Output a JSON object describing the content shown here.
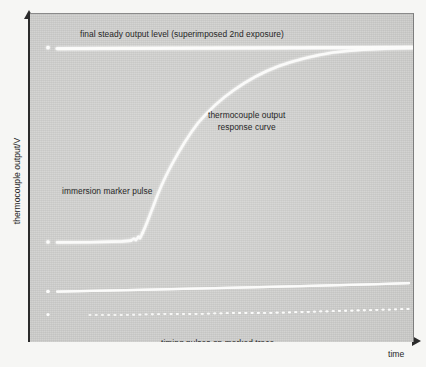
{
  "figure": {
    "kind": "oscilloscope-trace-photograph",
    "background_color": "#f6f6f4",
    "plot_background_color": "#d4d4d2",
    "trace_color": "#fbfbfa",
    "axis_color": "#2b2b2b"
  },
  "axes": {
    "y_title": "thermocouple output/V",
    "x_title": "time",
    "y_arrow_icon": "arrow-up-icon",
    "x_arrow_icon": "arrow-right-icon"
  },
  "annotations": {
    "final_level": "final steady output level (superimposed 2nd exposure)",
    "response_curve_line1": "thermocouple output",
    "response_curve_line2": "response curve",
    "immersion_marker": "immersion marker pulse",
    "timing_pulses": "timing pulses on marked trace"
  },
  "chart_data": {
    "type": "line",
    "title": "",
    "xlabel": "time",
    "ylabel": "thermocouple output/V",
    "grid": false,
    "legend": "none",
    "axis_style": "arrow-axes-unlabelled",
    "xlim": [
      0,
      383
    ],
    "ylim": [
      0,
      328
    ],
    "series": [
      {
        "name": "final steady output level (superimposed 2nd exposure)",
        "style": "solid-bright-horizontal",
        "x": [
          18,
          27,
          60,
          110,
          160,
          210,
          260,
          310,
          360,
          383
        ],
        "y": [
          35,
          34,
          34,
          34,
          34,
          34,
          34,
          34,
          34,
          34
        ]
      },
      {
        "name": "thermocouple output response curve",
        "style": "solid-bright-sigmoid",
        "x": [
          18,
          40,
          70,
          95,
          108,
          113,
          116,
          120,
          126,
          134,
          144,
          156,
          170,
          186,
          204,
          224,
          246,
          268,
          290,
          312,
          336,
          360,
          383
        ],
        "y": [
          228,
          228,
          227,
          226,
          225,
          222,
          218,
          212,
          202,
          186,
          166,
          144,
          122,
          103,
          87,
          73,
          62,
          53,
          46,
          41,
          37,
          35,
          34
        ]
      },
      {
        "name": "immersion marker pulse (baseline segment with step)",
        "style": "solid-bright-flat",
        "x": [
          18,
          40,
          70,
          95,
          105,
          110,
          112
        ],
        "y": [
          228,
          228,
          227,
          226,
          224,
          221,
          219
        ]
      },
      {
        "name": "second (marked) trace",
        "style": "solid-bright-slightly-tilted",
        "x": [
          18,
          60,
          120,
          180,
          240,
          300,
          350,
          383
        ],
        "y": [
          277,
          276,
          275,
          274,
          273,
          272,
          270,
          269
        ]
      },
      {
        "name": "timing pulses on marked trace",
        "style": "dotted-row",
        "x_start": 60,
        "x_end": 378,
        "y": [
          301,
          301,
          300,
          300,
          299,
          299,
          298,
          297,
          296,
          295
        ],
        "dot_spacing": 6.2,
        "dot_count": 52
      }
    ],
    "markers": [
      {
        "name": "left edge dot (top trace)",
        "x": 18,
        "y": 33
      },
      {
        "name": "left edge dot (response baseline)",
        "x": 18,
        "y": 228
      },
      {
        "name": "left edge dot (marked trace)",
        "x": 18,
        "y": 277
      },
      {
        "name": "left edge dot (timing row)",
        "x": 18,
        "y": 301
      }
    ]
  }
}
